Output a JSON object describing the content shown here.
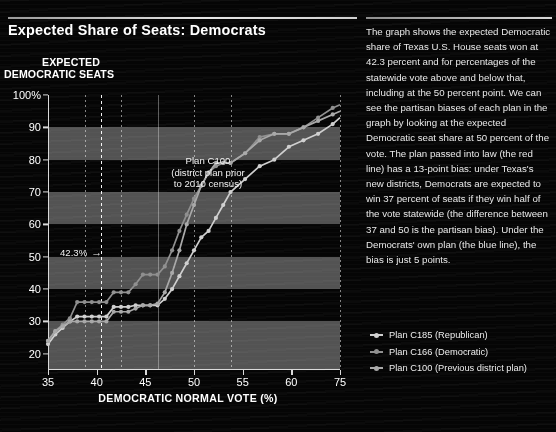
{
  "headline": "Expected Share of Seats: Democrats",
  "axis_title_y_line1": "EXPECTED",
  "axis_title_y_line2": "DEMOCRATIC SEATS",
  "axis_title_x": "DEMOCRATIC NORMAL VOTE (%)",
  "annotations": {
    "c100_line1": "Plan C100",
    "c100_line2": "(district plan prior",
    "c100_line3": "to 2010 census)",
    "marker_label": "42.3%",
    "marker_arrow": "→"
  },
  "sidebar": {
    "paragraph": "The graph shows the expected Democratic share of Texas U.S. House seats won at 42.3 percent and for percentages of the statewide vote above and below that, including at the 50 percent point.  We can see the partisan biases of each plan in the graph by looking at the expected Democratic seat share at 50 percent of the vote. The plan passed into law (the red line) has a 13-point bias:  under Texas's new districts, Democrats are expected to win 37 percent of seats if they win half of the vote statewide (the difference between 37 and 50 is the partisan bias). Under the Democrats' own plan (the blue line), the bias is just 5 points."
  },
  "legend": [
    {
      "label": "Plan C185 (Republican)",
      "color": "#cfcfcf"
    },
    {
      "label": "Plan C166 (Democratic)",
      "color": "#8f8f8f"
    },
    {
      "label": "Plan C100 (Previous district plan)",
      "color": "#a8a8a8"
    }
  ],
  "chart_data": {
    "type": "line",
    "title": "Expected Share of Seats: Democrats",
    "xlabel": "DEMOCRATIC NORMAL VOTE (%)",
    "ylabel": "EXPECTED DEMOCRATIC SEATS",
    "xlim": [
      35,
      75
    ],
    "ylim": [
      15,
      100
    ],
    "xticks": [
      35,
      40,
      45,
      50,
      55,
      60,
      75
    ],
    "yticks": [
      20,
      30,
      40,
      50,
      60,
      70,
      80,
      90,
      100
    ],
    "ytick_labels": [
      "20",
      "30",
      "40",
      "50",
      "60",
      "70",
      "80",
      "90",
      "100%"
    ],
    "grid": "vertical-dotted",
    "legend_position": "bottom-right-outside",
    "marker_vline": {
      "x": 42.3,
      "label": "42.3%"
    },
    "series": [
      {
        "name": "Plan C185 (Republican)",
        "color": "#cfcfcf",
        "x": [
          35,
          36,
          37,
          38,
          39,
          40,
          41,
          42,
          43,
          44,
          45,
          46,
          47,
          48,
          49,
          50,
          51,
          52,
          53,
          54,
          55,
          56,
          57,
          58,
          59,
          60,
          62,
          64,
          66,
          68,
          70,
          72,
          74,
          75
        ],
        "values": [
          23,
          26,
          28,
          30,
          31.5,
          31.5,
          31.5,
          31.5,
          31.5,
          34.5,
          34.5,
          34.5,
          35,
          35,
          35,
          35,
          37,
          40,
          44,
          48,
          52,
          56,
          58,
          62,
          66,
          70,
          74,
          78,
          80,
          84,
          86,
          88,
          91,
          93
        ]
      },
      {
        "name": "Plan C166 (Democratic)",
        "color": "#8f8f8f",
        "x": [
          35,
          36,
          37,
          38,
          39,
          40,
          41,
          42,
          43,
          44,
          45,
          46,
          47,
          48,
          49,
          50,
          51,
          52,
          53,
          54,
          55,
          56,
          57,
          58,
          59,
          60,
          62,
          64,
          66,
          68,
          70,
          72,
          74,
          75
        ],
        "values": [
          24,
          27,
          29,
          31,
          36,
          36,
          36,
          36,
          36,
          39,
          39,
          39,
          41.5,
          44.5,
          44.5,
          44.5,
          47,
          52,
          58,
          63,
          68,
          72,
          76,
          78,
          79,
          79,
          82,
          87,
          88,
          88,
          90,
          93,
          96,
          97
        ]
      },
      {
        "name": "Plan C100 (Previous district plan)",
        "color": "#a8a8a8",
        "x": [
          35,
          36,
          37,
          38,
          39,
          40,
          41,
          42,
          43,
          44,
          45,
          46,
          47,
          48,
          49,
          50,
          51,
          52,
          53,
          54,
          55,
          56,
          57,
          58,
          59,
          60,
          62,
          64,
          66,
          68,
          70,
          72,
          74,
          75
        ],
        "values": [
          24,
          27,
          28.5,
          30,
          30,
          30,
          30,
          30,
          30,
          33,
          33,
          33,
          34,
          35,
          35,
          35.5,
          39,
          45,
          52,
          60,
          66,
          72,
          76,
          79,
          79,
          79,
          82,
          86,
          88,
          88,
          90,
          92,
          94,
          95
        ]
      }
    ]
  }
}
